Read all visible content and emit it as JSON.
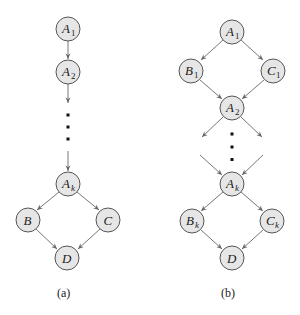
{
  "diagram_a": {
    "caption": "(a)",
    "nodes": [
      {
        "id": "A1",
        "base": "A",
        "sub": "1"
      },
      {
        "id": "A2",
        "base": "A",
        "sub": "2"
      },
      {
        "id": "Ak",
        "base": "A",
        "sub": "k"
      },
      {
        "id": "B",
        "base": "B",
        "sub": ""
      },
      {
        "id": "C",
        "base": "C",
        "sub": ""
      },
      {
        "id": "D",
        "base": "D",
        "sub": ""
      }
    ],
    "edges": [
      [
        "A1",
        "A2"
      ],
      [
        "A2",
        "..."
      ],
      [
        "...",
        "Ak"
      ],
      [
        "Ak",
        "B"
      ],
      [
        "Ak",
        "C"
      ],
      [
        "B",
        "D"
      ],
      [
        "C",
        "D"
      ]
    ]
  },
  "diagram_b": {
    "caption": "(b)",
    "nodes": [
      {
        "id": "A1",
        "base": "A",
        "sub": "1"
      },
      {
        "id": "B1",
        "base": "B",
        "sub": "1"
      },
      {
        "id": "C1",
        "base": "C",
        "sub": "1"
      },
      {
        "id": "A2",
        "base": "A",
        "sub": "2"
      },
      {
        "id": "Ak",
        "base": "A",
        "sub": "k"
      },
      {
        "id": "Bk",
        "base": "B",
        "sub": "k"
      },
      {
        "id": "Ck",
        "base": "C",
        "sub": "k"
      },
      {
        "id": "D",
        "base": "D",
        "sub": ""
      }
    ],
    "edges": [
      [
        "A1",
        "B1"
      ],
      [
        "A1",
        "C1"
      ],
      [
        "B1",
        "A2"
      ],
      [
        "C1",
        "A2"
      ],
      [
        "A2",
        "..."
      ],
      [
        "...",
        "Ak"
      ],
      [
        "Ak",
        "Bk"
      ],
      [
        "Ak",
        "Ck"
      ],
      [
        "Bk",
        "D"
      ],
      [
        "Ck",
        "D"
      ]
    ]
  },
  "colors": {
    "node_fill": "#e6e6e6",
    "node_stroke": "#555555",
    "edge": "#666666"
  }
}
